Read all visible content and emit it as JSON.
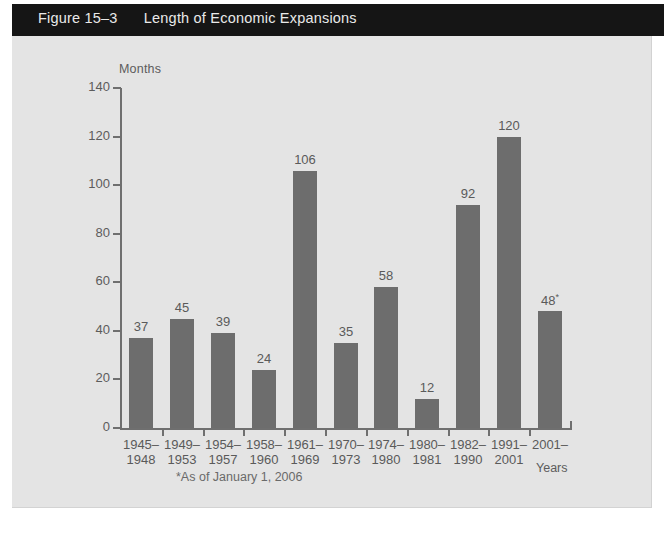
{
  "figure": {
    "number": "Figure 15–3",
    "title": "Length of Economic Expansions",
    "footnote": "*As of January 1, 2006",
    "bottom_caption": ""
  },
  "colors": {
    "title_bar_bg": "#151515",
    "title_bar_text": "#e9e9e9",
    "panel_bg": "#e4e4e4",
    "bar_fill": "#6d6d6d",
    "axis": "#6f6f6f",
    "label_text": "#5a5a5a"
  },
  "chart_data": {
    "type": "bar",
    "title": "Length of Economic Expansions",
    "xlabel": "Years",
    "ylabel": "Months",
    "ylim": [
      0,
      140
    ],
    "yticks": [
      0,
      20,
      40,
      60,
      80,
      100,
      120,
      140
    ],
    "grid": false,
    "legend": null,
    "categories": [
      "1945–\n1948",
      "1949–\n1953",
      "1954–\n1957",
      "1958–\n1960",
      "1961–\n1969",
      "1970–\n1973",
      "1974–\n1980",
      "1980–\n1981",
      "1982–\n1990",
      "1991–\n2001",
      "2001–"
    ],
    "category_lines": [
      [
        "1945–",
        "1948"
      ],
      [
        "1949–",
        "1953"
      ],
      [
        "1954–",
        "1957"
      ],
      [
        "1958–",
        "1960"
      ],
      [
        "1961–",
        "1969"
      ],
      [
        "1970–",
        "1973"
      ],
      [
        "1974–",
        "1980"
      ],
      [
        "1980–",
        "1981"
      ],
      [
        "1982–",
        "1990"
      ],
      [
        "1991–",
        "2001"
      ],
      [
        "2001–",
        ""
      ]
    ],
    "values": [
      37,
      45,
      39,
      24,
      106,
      35,
      58,
      12,
      92,
      120,
      48
    ],
    "data_labels": [
      "37",
      "45",
      "39",
      "24",
      "106",
      "35",
      "58",
      "12",
      "92",
      "120",
      "48"
    ],
    "annotations": [
      {
        "series_index": 10,
        "marker": "*",
        "note": "As of January 1, 2006"
      }
    ]
  }
}
